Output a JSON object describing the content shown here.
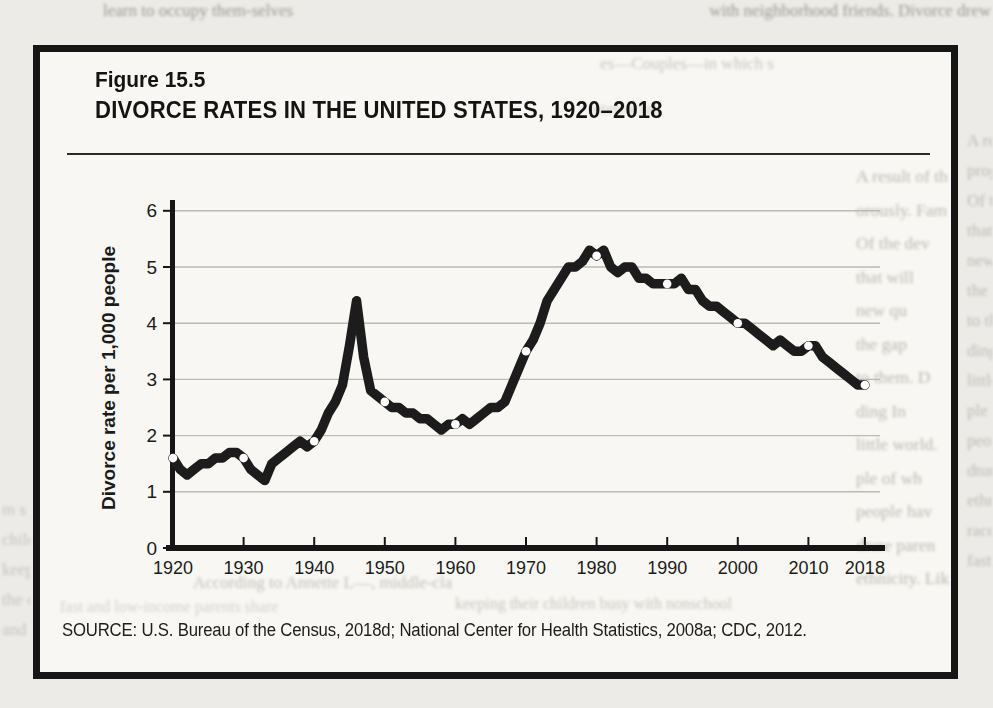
{
  "page": {
    "bleed_top_left": "learn to occupy them-selves",
    "bleed_top_right": "with neighborhood friends. Divorce drew",
    "bleed_left_margin": [
      "m s",
      "child",
      "keep",
      "the c",
      "and"
    ],
    "bleed_right_margin": [
      "A re",
      "prog",
      "Of t",
      "that",
      "new",
      "the g",
      "to th",
      "ding",
      "little",
      "ple o",
      "peop",
      "dtur",
      "ethn",
      "race",
      "fast"
    ]
  },
  "figure": {
    "label": "Figure 15.5",
    "title": "DIVORCE RATES IN THE UNITED STATES, 1920–2018",
    "source": "SOURCE: U.S. Bureau of the Census, 2018d; National Center for Health Statistics, 2008a; CDC, 2012.",
    "bleed_inside_top_1": "es—Couples—in which s",
    "bleed_inside_top_2": "interracial.",
    "bleed_inside_right": [
      "A result of th",
      "orously. Fam",
      "Of the dev",
      "that will",
      "new qu",
      "the gap",
      "to them. D",
      "ding In",
      "little world.",
      "ple of wh",
      "people hav",
      "dture paren",
      "ethnicity. Lik"
    ],
    "bleed_inside_bottom_1": "According to Annette L—, middle-cla",
    "bleed_inside_bottom_2": "fast and low-income parents share",
    "bleed_inside_bottom_3": "keeping their children busy with nonschool"
  },
  "chart_data": {
    "type": "line",
    "title": "DIVORCE RATES IN THE UNITED STATES, 1920–2018",
    "xlabel": "",
    "ylabel": "Divorce rate per 1,000 people",
    "ylim": [
      0,
      6
    ],
    "yticks": [
      0,
      1,
      2,
      3,
      4,
      5,
      6
    ],
    "xticks": [
      1920,
      1930,
      1940,
      1950,
      1960,
      1970,
      1980,
      1990,
      2000,
      2010,
      2018
    ],
    "grid": true,
    "legend": "none",
    "start_year": 1920,
    "values": [
      1.6,
      1.4,
      1.3,
      1.4,
      1.5,
      1.5,
      1.6,
      1.6,
      1.7,
      1.7,
      1.6,
      1.4,
      1.3,
      1.2,
      1.5,
      1.6,
      1.7,
      1.8,
      1.9,
      1.8,
      1.9,
      2.1,
      2.4,
      2.6,
      2.9,
      3.6,
      4.4,
      3.4,
      2.8,
      2.7,
      2.6,
      2.5,
      2.5,
      2.4,
      2.4,
      2.3,
      2.3,
      2.2,
      2.1,
      2.2,
      2.2,
      2.3,
      2.2,
      2.3,
      2.4,
      2.5,
      2.5,
      2.6,
      2.9,
      3.2,
      3.5,
      3.7,
      4.0,
      4.4,
      4.6,
      4.8,
      5.0,
      5.0,
      5.1,
      5.3,
      5.2,
      5.3,
      5.0,
      4.9,
      5.0,
      5.0,
      4.8,
      4.8,
      4.7,
      4.7,
      4.7,
      4.7,
      4.8,
      4.6,
      4.6,
      4.4,
      4.3,
      4.3,
      4.2,
      4.1,
      4.0,
      4.0,
      3.9,
      3.8,
      3.7,
      3.6,
      3.7,
      3.6,
      3.5,
      3.5,
      3.6,
      3.6,
      3.4,
      3.3,
      3.2,
      3.1,
      3.0,
      2.9,
      2.9
    ],
    "marker_years": [
      1920,
      1930,
      1940,
      1950,
      1960,
      1970,
      1980,
      1990,
      2000,
      2010,
      2018
    ],
    "line_color": "#1c1c1c",
    "marker_fill": "#ffffff",
    "grid_color": "#bcbab4",
    "axis_color": "#161616"
  }
}
